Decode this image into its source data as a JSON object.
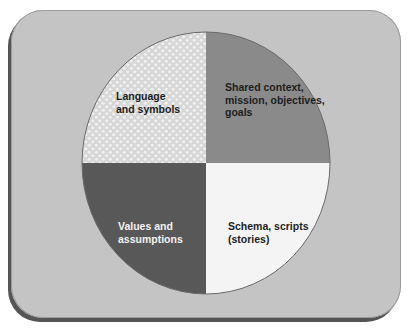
{
  "diagram": {
    "type": "quadrant-circle",
    "colors": {
      "panel": "#c4c4c4",
      "panel_shadow": "#555555",
      "top_left": "#dcdcdc",
      "top_left_dots": "#efefef",
      "top_right": "#8a8a8a",
      "bottom_left": "#585858",
      "bottom_right": "#f4f4f4",
      "outline": "#6a6a6a"
    },
    "quadrants": [
      {
        "position": "top-left",
        "pattern": "dotted",
        "lines": [
          "Language",
          "and symbols"
        ]
      },
      {
        "position": "top-right",
        "pattern": "solid",
        "lines": [
          "Shared context,",
          "mission, objectives,",
          "goals"
        ]
      },
      {
        "position": "bottom-left",
        "pattern": "solid",
        "lines": [
          "Values and",
          "assumptions"
        ]
      },
      {
        "position": "bottom-right",
        "pattern": "solid",
        "lines": [
          "Schema, scripts",
          "(stories)"
        ]
      }
    ]
  }
}
